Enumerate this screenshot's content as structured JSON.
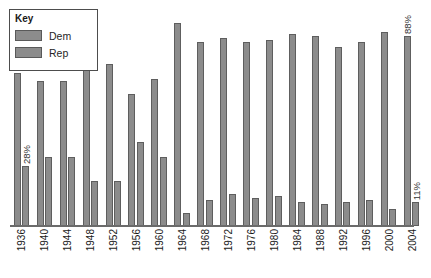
{
  "legend": {
    "title": "Key",
    "entries": [
      {
        "label": "Dem",
        "color": "#8c8c8c"
      },
      {
        "label": "Rep",
        "color": "#8c8c8c"
      }
    ]
  },
  "annotations": {
    "first_dem": "71%",
    "first_rep": "28%",
    "last_dem": "88%",
    "last_rep": "11%"
  },
  "chart_data": {
    "type": "bar",
    "title": "",
    "xlabel": "",
    "ylabel": "",
    "ylim": [
      0,
      100
    ],
    "grid": false,
    "legend_position": "top-left",
    "categories": [
      "1936",
      "1940",
      "1944",
      "1948",
      "1952",
      "1956",
      "1960",
      "1964",
      "1968",
      "1972",
      "1976",
      "1980",
      "1984",
      "1988",
      "1992",
      "1996",
      "2000",
      "2004"
    ],
    "series": [
      {
        "name": "Dem",
        "color": "#8c8c8c",
        "values": [
          71,
          67,
          67,
          76,
          75,
          61,
          68,
          94,
          85,
          87,
          85,
          86,
          89,
          88,
          83,
          85,
          90,
          88
        ]
      },
      {
        "name": "Rep",
        "color": "#8c8c8c",
        "values": [
          28,
          32,
          32,
          21,
          21,
          39,
          32,
          6,
          12,
          15,
          13,
          14,
          11,
          10,
          11,
          12,
          8,
          11
        ]
      }
    ],
    "data_labels": [
      {
        "category": "1936",
        "series": "Dem",
        "text": "71%"
      },
      {
        "category": "1936",
        "series": "Rep",
        "text": "28%"
      },
      {
        "category": "2004",
        "series": "Dem",
        "text": "88%"
      },
      {
        "category": "2004",
        "series": "Rep",
        "text": "11%"
      }
    ]
  }
}
